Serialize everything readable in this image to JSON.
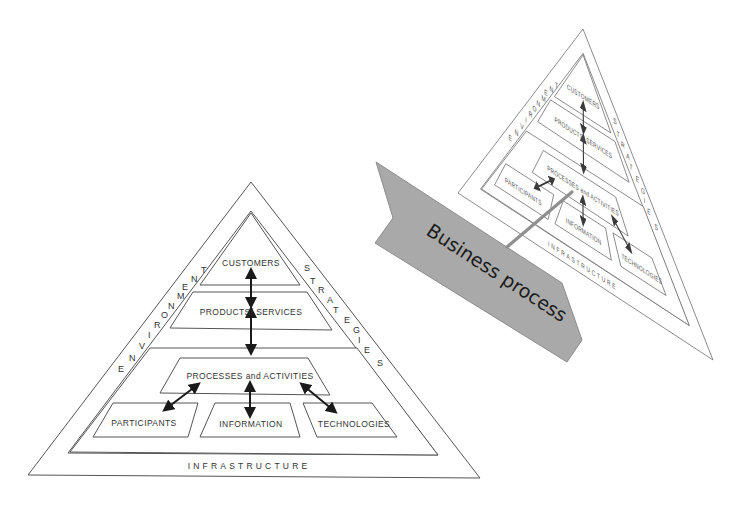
{
  "diagram": {
    "pyramid": {
      "top_box": "CUSTOMERS",
      "second_box": "PRODUCTS/ SERVICES",
      "core_box": "PROCESSES and ACTIVITIES",
      "bottom_boxes": [
        "PARTICIPANTS",
        "INFORMATION",
        "TECHNOLOGIES"
      ],
      "base_label": "INFRASTRUCTURE",
      "left_edge_label": "ENVIRONMENT",
      "right_edge_label": "STRATEGIES",
      "left_edge_letters": [
        "E",
        "N",
        "V",
        "I",
        "R",
        "O",
        "N",
        "M",
        "E",
        "N",
        "T"
      ],
      "right_edge_letters": [
        "S",
        "T",
        "R",
        "A",
        "T",
        "E",
        "G",
        "I",
        "E",
        "S"
      ]
    },
    "banner": {
      "label": "Business process",
      "fill_color": "#a9a9a9",
      "border_color": "#8c8c8c"
    },
    "colors": {
      "line": "#555555",
      "text": "#333333",
      "arrow": "#1a1a1a",
      "connector": "#8f8f8f",
      "background": "#ffffff"
    }
  }
}
